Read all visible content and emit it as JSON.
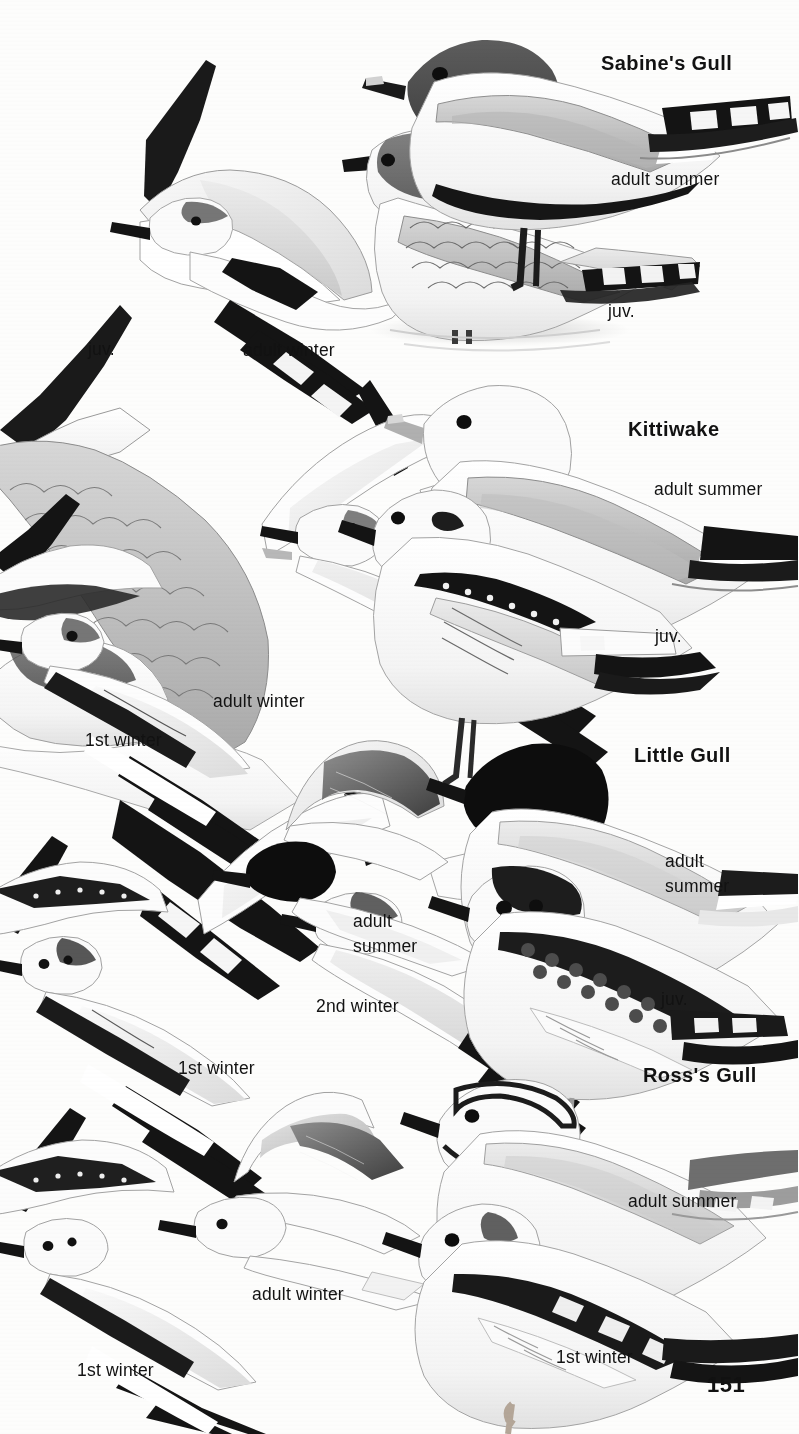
{
  "page": {
    "number": "151",
    "background": "#fdfdfc",
    "ink": "#121212",
    "type": "field-guide-plate"
  },
  "species": [
    {
      "id": "sabines-gull",
      "name": "Sabine's Gull",
      "heading_pos": {
        "x": 601,
        "y": 52
      },
      "plumages": [
        {
          "id": "sabine-juv-flight",
          "label": "juv.",
          "x": 88,
          "y": 340
        },
        {
          "id": "sabine-adult-winter",
          "label": "adult winter",
          "x": 243,
          "y": 341
        },
        {
          "id": "sabine-adult-summer",
          "label": "adult summer",
          "x": 611,
          "y": 170
        },
        {
          "id": "sabine-juv-standing",
          "label": "juv.",
          "x": 608,
          "y": 302
        }
      ]
    },
    {
      "id": "kittiwake",
      "name": "Kittiwake",
      "heading_pos": {
        "x": 628,
        "y": 418
      },
      "plumages": [
        {
          "id": "kittiwake-1st-winter",
          "label": "1st winter",
          "x": 85,
          "y": 731
        },
        {
          "id": "kittiwake-adult-winter",
          "label": "adult winter",
          "x": 213,
          "y": 692
        },
        {
          "id": "kittiwake-adult-summer",
          "label": "adult summer",
          "x": 654,
          "y": 480
        },
        {
          "id": "kittiwake-juv",
          "label": "juv.",
          "x": 655,
          "y": 627
        }
      ]
    },
    {
      "id": "little-gull",
      "name": "Little Gull",
      "heading_pos": {
        "x": 634,
        "y": 744
      },
      "plumages": [
        {
          "id": "little-1st-winter",
          "label": "1st winter",
          "x": 178,
          "y": 1059
        },
        {
          "id": "little-2nd-winter",
          "label": "2nd winter",
          "x": 316,
          "y": 997
        },
        {
          "id": "little-adult-summer-flight",
          "label": "adult\nsummer",
          "x": 353,
          "y": 909
        },
        {
          "id": "little-adult-summer",
          "label": "adult\nsummer",
          "x": 665,
          "y": 849
        },
        {
          "id": "little-juv",
          "label": "juv.",
          "x": 661,
          "y": 990
        }
      ]
    },
    {
      "id": "rosss-gull",
      "name": "Ross's Gull",
      "heading_pos": {
        "x": 643,
        "y": 1064
      },
      "plumages": [
        {
          "id": "ross-1st-winter-flight",
          "label": "1st winter",
          "x": 77,
          "y": 1361
        },
        {
          "id": "ross-adult-winter",
          "label": "adult winter",
          "x": 252,
          "y": 1285
        },
        {
          "id": "ross-adult-summer",
          "label": "adult summer",
          "x": 628,
          "y": 1192
        },
        {
          "id": "ross-1st-winter",
          "label": "1st winter",
          "x": 556,
          "y": 1348
        }
      ]
    }
  ],
  "page_number_pos": {
    "x": 707,
    "y": 1372
  }
}
